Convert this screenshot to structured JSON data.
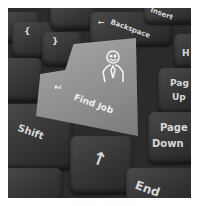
{
  "image": {
    "description": "Close-up photo of a black computer keyboard with a grey Enter key relabeled 'Find Job' with a smiling stick-figure person icon",
    "keys": {
      "find_job": "Find Job",
      "backspace": "Backspace",
      "insert": "Insert",
      "home_partial": "H",
      "page_up_1": "Pag",
      "page_up_2": "Up",
      "page_down_1": "Page",
      "page_down_2": "Down",
      "shift": "Shift",
      "end": "End",
      "up_arrow": "↑",
      "enter_arrow": "↵",
      "backspace_arrow": "←"
    },
    "watermark": "· · · · · · · · · · · · · · · ·"
  }
}
